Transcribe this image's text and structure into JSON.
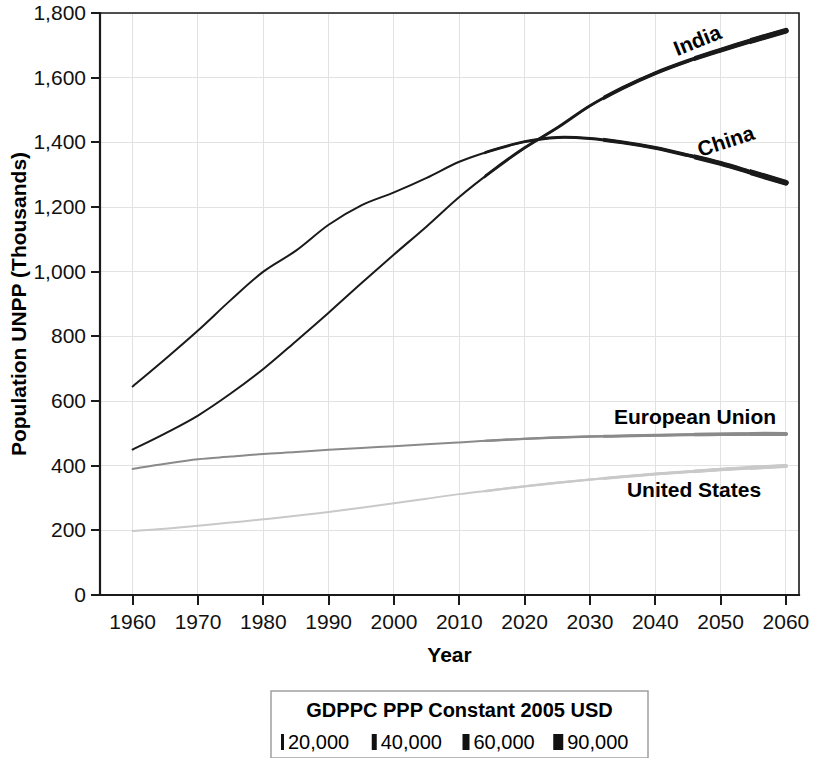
{
  "chart_data": {
    "type": "line",
    "title": "",
    "xlabel": "Year",
    "ylabel": "Population UNPP (Thousands)",
    "xlim": [
      1955,
      2062
    ],
    "ylim": [
      0,
      1800
    ],
    "xticks": [
      "1960",
      "1970",
      "1980",
      "1990",
      "2000",
      "2010",
      "2020",
      "2030",
      "2040",
      "2050",
      "2060"
    ],
    "yticks": [
      "0",
      "200",
      "400",
      "600",
      "800",
      "1,000",
      "1,200",
      "1,400",
      "1,600",
      "1,800"
    ],
    "grid": true,
    "legend_position": "below-plot",
    "x": [
      1960,
      1965,
      1970,
      1975,
      1980,
      1985,
      1990,
      1995,
      2000,
      2005,
      2010,
      2015,
      2020,
      2025,
      2030,
      2035,
      2040,
      2045,
      2050,
      2055,
      2060
    ],
    "series": [
      {
        "name": "India",
        "color": "#1a1a1a",
        "label_rotation": -22,
        "values": [
          450,
          500,
          555,
          623,
          699,
          785,
          873,
          964,
          1053,
          1140,
          1231,
          1311,
          1383,
          1445,
          1513,
          1568,
          1614,
          1652,
          1685,
          1716,
          1745
        ]
      },
      {
        "name": "China",
        "color": "#1a1a1a",
        "label_rotation": -18,
        "values": [
          645,
          730,
          818,
          912,
          1000,
          1065,
          1145,
          1205,
          1245,
          1290,
          1340,
          1375,
          1402,
          1415,
          1412,
          1400,
          1383,
          1360,
          1335,
          1305,
          1275
        ]
      },
      {
        "name": "European Union",
        "color": "#8a8a8a",
        "label_rotation": 0,
        "values": [
          390,
          406,
          420,
          428,
          436,
          442,
          449,
          455,
          460,
          466,
          472,
          478,
          483,
          487,
          490,
          492,
          494,
          496,
          497,
          498,
          498
        ]
      },
      {
        "name": "United States",
        "color": "#c9c9c9",
        "label_rotation": 0,
        "values": [
          198,
          205,
          214,
          224,
          234,
          245,
          257,
          270,
          284,
          298,
          312,
          324,
          336,
          347,
          357,
          366,
          374,
          381,
          388,
          394,
          399
        ]
      }
    ],
    "legend": {
      "title": "GDPPC PPP Constant 2005 USD",
      "entries": [
        {
          "label": "20,000",
          "marker_width": 3
        },
        {
          "label": "40,000",
          "marker_width": 5
        },
        {
          "label": "60,000",
          "marker_width": 7
        },
        {
          "label": "90,000",
          "marker_width": 10
        }
      ]
    }
  }
}
